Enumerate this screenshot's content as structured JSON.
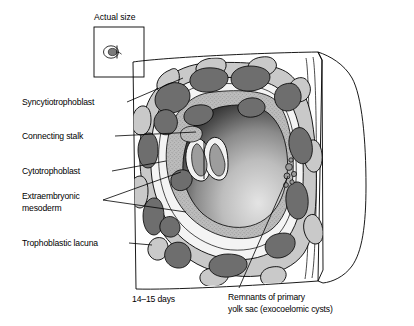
{
  "figure": {
    "title_inset": "Actual size",
    "caption_stage": "14–15 days",
    "labels": [
      {
        "id": "syncytiotrophoblast",
        "text": "Syncytiotrophoblast"
      },
      {
        "id": "connecting-stalk",
        "text": "Connecting stalk"
      },
      {
        "id": "cytotrophoblast",
        "text": "Cytotrophoblast"
      },
      {
        "id": "extraembryonic-mesoderm-line1",
        "text": "Extraembryonic"
      },
      {
        "id": "extraembryonic-mesoderm-line2",
        "text": "mesoderm"
      },
      {
        "id": "trophoblastic-lacuna",
        "text": "Trophoblastic lacuna"
      },
      {
        "id": "remnants-line1",
        "text": "Remnants of primary"
      },
      {
        "id": "remnants-line2",
        "text": "yolk sac (exocoelomic cysts)"
      }
    ],
    "colors": {
      "background": "#ffffff",
      "ink": "#000000",
      "lacuna_dark_gray": "#6e6e6e",
      "syncytiotrophoblast_gray": "#c9c9c9",
      "cytotrophoblast_white": "#f4f4f4",
      "mesoderm_stipple": "#b4b4b4",
      "chorionic_cavity_dark": "#2b2b2b",
      "chorionic_cavity_light": "#d8d8d8",
      "endometrium_face": "#ffffff"
    },
    "structures": [
      "endometrial tissue block",
      "syncytiotrophoblast layer",
      "cytotrophoblast layer",
      "trophoblastic lacunae",
      "extraembryonic mesoderm",
      "chorionic cavity",
      "bilaminar embryonic disc",
      "amniotic cavity",
      "connecting stalk",
      "exocoelomic cysts"
    ]
  }
}
